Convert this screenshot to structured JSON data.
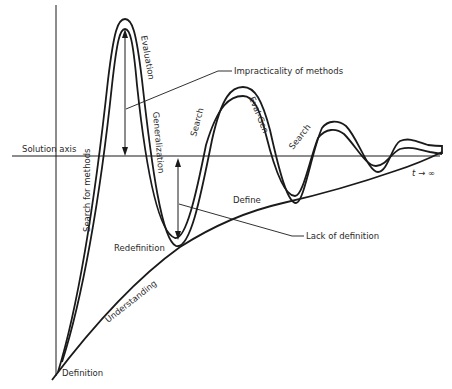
{
  "diagram": {
    "type": "problem-solving oscillation diagram",
    "axes": {
      "solution_axis_label": "Solution axis",
      "time_label": "t → ∞"
    },
    "curve_labels": {
      "search_for_methods": "Search for methods",
      "evaluation": "Evaluation",
      "generalization": "Generalization",
      "search_1": "Search",
      "eval_gen": "Eval-Gen",
      "search_2": "Search",
      "understanding": "Understanding"
    },
    "point_labels": {
      "definition": "Definition",
      "redefinition": "Redefinition",
      "define": "Define"
    },
    "callouts": {
      "impracticality": "Impracticality of methods",
      "lack_of_definition": "Lack of definition"
    },
    "colors": {
      "ink": "#1a1a1a",
      "background": "#ffffff"
    }
  }
}
